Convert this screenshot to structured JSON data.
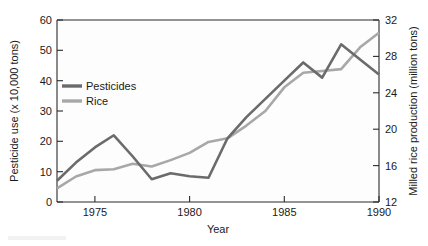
{
  "chart_data": {
    "type": "line",
    "title": "",
    "xlabel": "Year",
    "ylabel": "Pesticide use (x 10,000 tons)",
    "y2label": "Milled rice production (million tons)",
    "x": [
      1973,
      1974,
      1975,
      1976,
      1977,
      1978,
      1979,
      1980,
      1981,
      1982,
      1983,
      1984,
      1985,
      1986,
      1987,
      1988,
      1989,
      1990
    ],
    "xlim": [
      1973,
      1990
    ],
    "xticks": [
      1975,
      1980,
      1985,
      1990
    ],
    "xtick_labels": [
      "1975",
      "1980",
      "1985",
      "1990"
    ],
    "ylim": [
      0,
      60
    ],
    "yticks": [
      0,
      10,
      20,
      30,
      40,
      50,
      60
    ],
    "ytick_labels": [
      "0",
      "10",
      "20",
      "30",
      "40",
      "50",
      "60"
    ],
    "y2lim": [
      12,
      32
    ],
    "y2ticks": [
      12,
      16,
      20,
      24,
      28,
      32
    ],
    "y2tick_labels": [
      "12",
      "16",
      "20",
      "24",
      "28",
      "32"
    ],
    "grid": false,
    "legend_position": "upper-left-inside",
    "series": [
      {
        "name": "Pesticides",
        "axis": "left",
        "units": "x 10,000 tons",
        "color": "#6b6b6b",
        "values": [
          7,
          13,
          18,
          22,
          15,
          7.5,
          9.5,
          8.5,
          8,
          21,
          28,
          34,
          40,
          46,
          41,
          52,
          47,
          42
        ]
      },
      {
        "name": "Rice",
        "axis": "right",
        "units": "million tons",
        "color": "#a8a8a8",
        "values": [
          13.5,
          14.8,
          15.5,
          15.6,
          16.2,
          15.9,
          16.6,
          17.4,
          18.6,
          19.0,
          20.4,
          22.0,
          24.6,
          26.2,
          26.4,
          26.6,
          29.0,
          30.6
        ]
      }
    ],
    "pesticides_detail": {
      "1973": 7,
      "1975": 18,
      "1976": 22,
      "1977": 15,
      "1978": 7.5,
      "1979": 9.5,
      "1981": 8,
      "1983": 28,
      "1985": 40,
      "1986": 46,
      "1987": 58,
      "1990": 22
    },
    "annotations": []
  },
  "legend": {
    "items": [
      {
        "label": "Pesticides",
        "color": "#6b6b6b"
      },
      {
        "label": "Rice",
        "color": "#a8a8a8"
      }
    ]
  },
  "axes": {
    "left_title": "Pesticide use (x 10,000 tons)",
    "right_title": "Milled rice production (million tons)",
    "bottom_title": "Year"
  }
}
